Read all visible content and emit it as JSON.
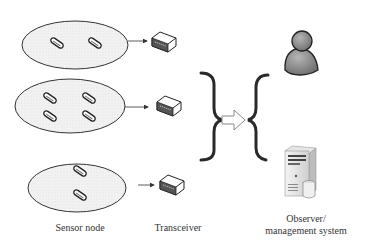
{
  "diagram": {
    "clusters": [
      {
        "id": "cluster-1",
        "sensor_count": 2
      },
      {
        "id": "cluster-2",
        "sensor_count": 4
      },
      {
        "id": "cluster-3",
        "sensor_count": 2
      }
    ],
    "labels": {
      "sensor_node": "Sensor node",
      "transceiver": "Transceiver",
      "observer_line1": "Observer/",
      "observer_line2": "management system"
    },
    "icons": [
      "sensor-node-icon",
      "transceiver-icon",
      "brace-icon",
      "arrow-right-icon",
      "user-icon",
      "server-icon"
    ],
    "colors": {
      "ellipse_fill": "#efefef",
      "stroke": "#333333",
      "user_gray": "#8a8a8a"
    }
  }
}
